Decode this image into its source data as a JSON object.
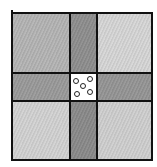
{
  "diagram": {
    "grid": {
      "rows": 3,
      "cols": 3
    },
    "colors": {
      "line": "#111111",
      "corner_top_left": "#b4b4b4",
      "corner_top_right": "#d6d6d6",
      "corner_bottom_left": "#d2d2d2",
      "corner_bottom_right": "#cfcfcf",
      "arm_top": "#8e8e8e",
      "arm_left": "#9a9a9a",
      "arm_right": "#959595",
      "arm_bottom": "#8a8a8a",
      "center": "#ffffff"
    },
    "center_dots": 5
  }
}
